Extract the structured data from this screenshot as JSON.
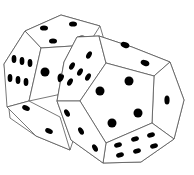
{
  "image": {
    "subject": "two twelve-sided dice",
    "background": "#ffffff",
    "outline_color": "#555555",
    "pip_color": "#000000"
  },
  "dice": [
    {
      "name": "back-die",
      "visible_faces": [
        {
          "face": "top",
          "pips": 4
        },
        {
          "face": "left",
          "pips": 6
        },
        {
          "face": "bottom",
          "pips": 2
        }
      ]
    },
    {
      "name": "front-die",
      "visible_faces": [
        {
          "face": "center",
          "pips": 4
        },
        {
          "face": "upper-left",
          "pips": 6
        },
        {
          "face": "top",
          "pips": 2
        },
        {
          "face": "right",
          "pips": 1
        },
        {
          "face": "bottom",
          "pips": 6
        },
        {
          "face": "lower-left",
          "pips": 3
        }
      ]
    }
  ]
}
